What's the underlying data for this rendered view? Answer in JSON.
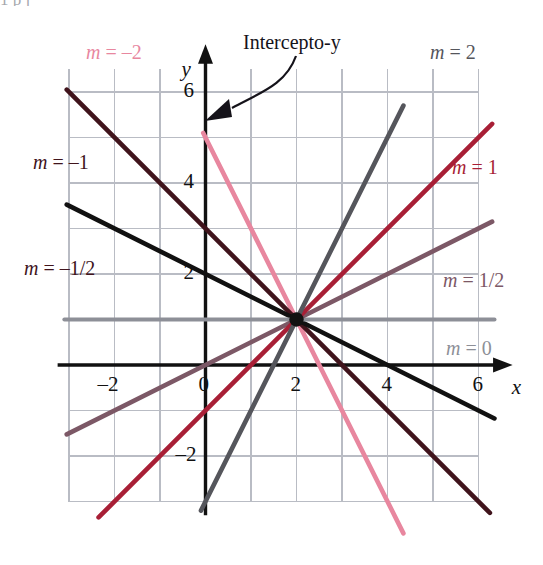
{
  "figure": {
    "intercept_annotation": "Intercepto-y",
    "top_partial_text": "1    p   j"
  },
  "axes": {
    "x_axis_label": "x",
    "y_axis_label": "y",
    "x_ticks": [
      {
        "value": -2,
        "label": "–2"
      },
      {
        "value": 0,
        "label": "0"
      },
      {
        "value": 2,
        "label": "2"
      },
      {
        "value": 4,
        "label": "4"
      },
      {
        "value": 6,
        "label": "6"
      }
    ],
    "y_ticks": [
      {
        "value": -2,
        "label": "–2"
      },
      {
        "value": 2,
        "label": "2"
      },
      {
        "value": 4,
        "label": "4"
      },
      {
        "value": 6,
        "label": "6"
      }
    ],
    "xlim": [
      -3.2,
      6.6
    ],
    "ylim": [
      -3.3,
      6.9
    ],
    "grid": true,
    "grid_color": "#b9bcc4",
    "axis_color": "#111111"
  },
  "chart_data": {
    "type": "line",
    "title": "Intercepto-y",
    "xlabel": "x",
    "ylabel": "y",
    "xlim": [
      -3.2,
      6.6
    ],
    "ylim": [
      -3.3,
      6.9
    ],
    "grid": true,
    "legend_position": "inline-labels",
    "common_point": {
      "x": 2,
      "y": 1
    },
    "series": [
      {
        "name": "m = -2",
        "slope": -2,
        "intercept": 5,
        "color": "#e8879f",
        "label": "m = –2",
        "label_color": "#e8879f",
        "label_x": 86,
        "label_y": 42,
        "x_from": -0.05,
        "x_to": 4.35
      },
      {
        "name": "m = -1",
        "slope": -1,
        "intercept": 3,
        "color": "#40141c",
        "label": "m = –1",
        "label_color": "#40141c",
        "label_x": 33,
        "label_y": 152,
        "x_from": -3.05,
        "x_to": 6.25
      },
      {
        "name": "m = -1/2",
        "slope": -0.5,
        "intercept": 2,
        "color": "#111111",
        "label": "m = –1/2",
        "label_color": "#40141c",
        "label_x": 24,
        "label_y": 258,
        "x_from": -3.05,
        "x_to": 6.35
      },
      {
        "name": "m = 0",
        "slope": 0,
        "intercept": 1,
        "color": "#8d8f97",
        "label": "m = 0",
        "label_color": "#8d8f97",
        "label_x": 446,
        "label_y": 338,
        "x_from": -3.1,
        "x_to": 6.35
      },
      {
        "name": "m = 1/2",
        "slope": 0.5,
        "intercept": 0,
        "color": "#7c5866",
        "label": "m = 1/2",
        "label_color": "#7c5866",
        "label_x": 443,
        "label_y": 270,
        "x_from": -3.05,
        "x_to": 6.3
      },
      {
        "name": "m = 1",
        "slope": 1,
        "intercept": -1,
        "color": "#a81f36",
        "label": "m = 1",
        "label_color": "#a81f36",
        "label_x": 452,
        "label_y": 157,
        "x_from": -2.35,
        "x_to": 6.3
      },
      {
        "name": "m = 2",
        "slope": 2,
        "intercept": -3,
        "color": "#55565c",
        "label": "m = 2",
        "label_color": "#55565c",
        "label_x": 430,
        "label_y": 42,
        "x_from": -0.1,
        "x_to": 4.35
      }
    ]
  }
}
